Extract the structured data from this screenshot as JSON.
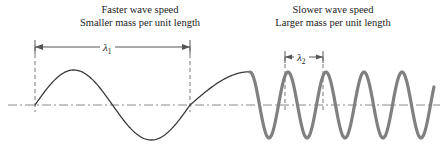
{
  "figure": {
    "width": 446,
    "height": 162,
    "background": "#ffffff"
  },
  "captions": {
    "left": {
      "line1": "Faster wave speed",
      "line2": "Smaller mass per unit length"
    },
    "right": {
      "line1": "Slower wave speed",
      "line2": "Larger mass per unit length"
    }
  },
  "dimensions": {
    "lambda1": {
      "symbol": "λ",
      "subscript": "1",
      "x_start": 35,
      "x_end": 190,
      "y": 47
    },
    "lambda2": {
      "symbol": "λ",
      "subscript": "2",
      "x_start": 285,
      "x_end": 323,
      "y": 57
    }
  },
  "colors": {
    "thin_wave": "#3a3a3a",
    "thick_wave": "#808080",
    "axis": "#8a8a8a",
    "dimension_line": "#555555",
    "leader_line": "#777777",
    "text": "#1a1a1a"
  },
  "chart_data": {
    "type": "line",
    "xlabel": "",
    "ylabel": "",
    "grid": false,
    "axis_y": 105,
    "axis_x_range": [
      8,
      440
    ],
    "annotations": [
      "Faster wave speed",
      "Smaller mass per unit length",
      "Slower wave speed",
      "Larger mass per unit length",
      "λ1",
      "λ2"
    ],
    "series": [
      {
        "name": "incident-wave-light-string",
        "stroke": "#3a3a3a",
        "stroke_width": 1.3,
        "wavelength_px": 155,
        "amplitude_px": 35,
        "x_start": 35,
        "x_end": 250
      },
      {
        "name": "transmitted-wave-heavy-string",
        "stroke": "#808080",
        "stroke_width": 3.2,
        "wavelength_px": 38,
        "amplitude_px": 33,
        "x_start": 250,
        "x_end": 434,
        "cycles": 4
      }
    ]
  }
}
